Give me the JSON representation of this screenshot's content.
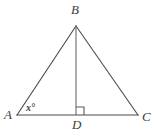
{
  "figure": {
    "kind": "triangle-with-altitude",
    "background_color": "#ffffff",
    "line_color": "#4a4a4a",
    "label_color": "#3d3d3d",
    "canvas": {
      "width": 159,
      "height": 140
    }
  },
  "vertices": {
    "A": {
      "label": "A",
      "x": 17,
      "y": 115
    },
    "B": {
      "label": "B",
      "x": 76,
      "y": 26
    },
    "C": {
      "label": "C",
      "x": 138,
      "y": 115
    },
    "D": {
      "label": "D",
      "x": 76,
      "y": 115
    }
  },
  "segments": [
    {
      "name": "AB",
      "from": "A",
      "to": "B"
    },
    {
      "name": "BC",
      "from": "B",
      "to": "C"
    },
    {
      "name": "AC",
      "from": "A",
      "to": "C"
    },
    {
      "name": "BD",
      "from": "B",
      "to": "D"
    }
  ],
  "angles": {
    "at_A": {
      "label": "x°",
      "variable": "x",
      "unit": "degrees"
    },
    "at_D": {
      "label": "",
      "marker": "right-angle-square",
      "measure": 90
    }
  }
}
